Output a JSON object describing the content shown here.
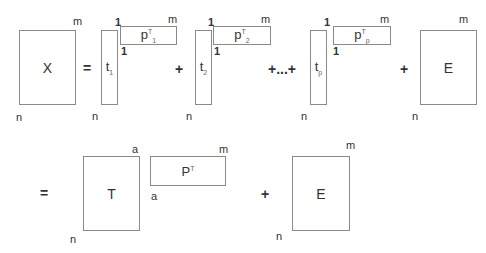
{
  "row1": {
    "X": {
      "label": "X",
      "rows": "n",
      "cols": "m"
    },
    "eq": "=",
    "terms": [
      {
        "t": "t",
        "t_sub": "1",
        "p": "p",
        "p_sup": "T",
        "p_sub": "1",
        "one_top": "1",
        "one_bottom": "1",
        "rows": "n",
        "cols": "m"
      },
      {
        "t": "t",
        "t_sub": "2",
        "p": "p",
        "p_sup": "T",
        "p_sub": "2",
        "one_top": "1",
        "one_bottom": "1",
        "rows": "n",
        "cols": "m"
      },
      {
        "t": "t",
        "t_sub": "p",
        "p": "p",
        "p_sup": "T",
        "p_sub": "p",
        "one_top": "1",
        "one_bottom": "1",
        "rows": "n",
        "cols": "m"
      }
    ],
    "plus": "+",
    "ellipsis": "+...+",
    "E": {
      "label": "E",
      "rows": "n",
      "cols": "m"
    }
  },
  "row2": {
    "eq": "=",
    "T": {
      "label": "T",
      "rows": "n",
      "cols": "a"
    },
    "P": {
      "label": "P",
      "sup": "T",
      "rows": "a",
      "cols": "m"
    },
    "plus": "+",
    "E": {
      "label": "E",
      "rows": "n",
      "cols": "m"
    }
  }
}
